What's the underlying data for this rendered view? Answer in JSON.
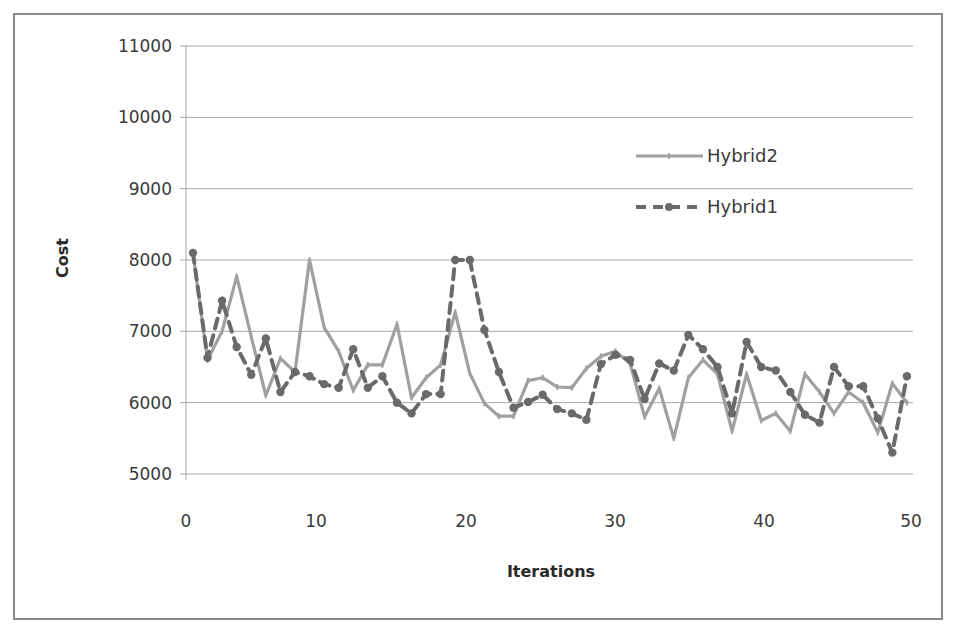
{
  "chart_data": {
    "type": "line",
    "title": "",
    "xlabel": "Iterations",
    "ylabel": "Cost",
    "xlim": [
      0,
      50
    ],
    "ylim": [
      5000,
      11000
    ],
    "x_ticks": [
      0,
      10,
      20,
      30,
      40,
      50
    ],
    "y_ticks": [
      5000,
      6000,
      7000,
      8000,
      9000,
      10000,
      11000
    ],
    "grid": {
      "horizontal": true,
      "vertical": false
    },
    "legend_position": "upper-right-inside",
    "x": [
      1,
      2,
      3,
      4,
      5,
      6,
      7,
      8,
      9,
      10,
      11,
      12,
      13,
      14,
      15,
      16,
      17,
      18,
      19,
      20,
      21,
      22,
      23,
      24,
      25,
      26,
      27,
      28,
      29,
      30,
      31,
      32,
      33,
      34,
      35,
      36,
      37,
      38,
      39,
      40,
      41,
      42,
      43,
      44,
      45,
      46,
      47,
      48,
      49,
      50
    ],
    "series": [
      {
        "name": "Hybrid2",
        "style": "solid",
        "marker": "tick",
        "color": "#a0a0a0",
        "values": [
          8100,
          6600,
          7000,
          7770,
          6920,
          6100,
          6620,
          6430,
          8000,
          7060,
          6720,
          6170,
          6530,
          6530,
          7100,
          6070,
          6350,
          6530,
          7270,
          6410,
          5990,
          5810,
          5810,
          6310,
          6350,
          6220,
          6210,
          6480,
          6650,
          6720,
          6550,
          5800,
          6200,
          5500,
          6350,
          6600,
          6400,
          5600,
          6400,
          5750,
          5850,
          5600,
          6400,
          6150,
          5850,
          6150,
          6000,
          5580,
          6270,
          6000
        ]
      },
      {
        "name": "Hybrid1",
        "style": "dashed",
        "marker": "circle",
        "color": "#6a6a6a",
        "values": [
          8100,
          6630,
          7430,
          6780,
          6390,
          6900,
          6150,
          6430,
          6370,
          6260,
          6210,
          6750,
          6210,
          6370,
          6000,
          5850,
          6120,
          6120,
          8000,
          8000,
          7020,
          6430,
          5930,
          6010,
          6110,
          5910,
          5850,
          5760,
          6540,
          6670,
          6600,
          6050,
          6550,
          6450,
          6950,
          6750,
          6500,
          5850,
          6850,
          6500,
          6450,
          6150,
          5830,
          5720,
          6500,
          6230,
          6230,
          5780,
          5300,
          6370
        ]
      }
    ]
  }
}
